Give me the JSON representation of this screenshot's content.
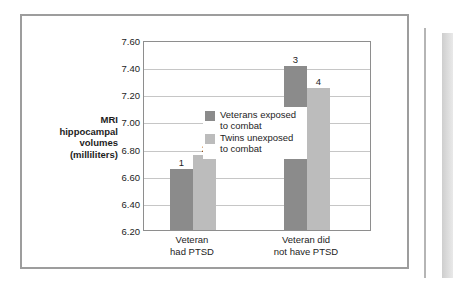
{
  "chart_data": {
    "type": "bar",
    "title": "",
    "xlabel": "",
    "ylabel": "MRI hippocampal volumes (milliliters)",
    "ylabel_lines": [
      "MRI",
      "hippocampal",
      "volumes",
      "(milliliters)"
    ],
    "ylim": [
      6.2,
      7.6
    ],
    "ytick_labels": [
      "7.60",
      "7.40",
      "7.20",
      "7.00",
      "6.80",
      "6.60",
      "6.40",
      "6.20"
    ],
    "ytick_values": [
      7.6,
      7.4,
      7.2,
      7.0,
      6.8,
      6.6,
      6.4,
      6.2
    ],
    "grid": true,
    "legend_position": "inside-right",
    "categories": [
      "Veteran had PTSD",
      "Veteran did not have PTSD"
    ],
    "category_lines": [
      [
        "Veteran",
        "had PTSD"
      ],
      [
        "Veteran did",
        "not have PTSD"
      ]
    ],
    "series": [
      {
        "name": "Veterans exposed to combat",
        "name_lines": [
          "Veterans exposed",
          "to combat"
        ],
        "color": "#8b8b8b",
        "values": [
          6.65,
          7.41
        ],
        "point_labels": [
          "1",
          "3"
        ]
      },
      {
        "name": "Twins unexposed to combat",
        "name_lines": [
          "Twins unexposed",
          "to combat"
        ],
        "color": "#bcbcbc",
        "values": [
          6.75,
          7.25
        ],
        "point_labels": [
          "2",
          "4"
        ]
      }
    ]
  },
  "legend": {
    "entries": [
      {
        "label": "Veterans exposed\nto combat",
        "color": "#8b8b8b"
      },
      {
        "label": "Twins unexposed\nto combat",
        "color": "#bcbcbc"
      }
    ]
  },
  "axes": {
    "y_title": "MRI\nhippocampal\nvolumes\n(milliliters)",
    "y_ticks": [
      "7.60",
      "7.40",
      "7.20",
      "7.00",
      "6.80",
      "6.60",
      "6.40",
      "6.20"
    ],
    "x_categories": [
      "Veteran\nhad PTSD",
      "Veteran did\nnot have PTSD"
    ]
  },
  "bars": [
    {
      "label": "1",
      "value": 6.65,
      "series": 0,
      "group": 0
    },
    {
      "label": "2",
      "value": 6.75,
      "series": 1,
      "group": 0
    },
    {
      "label": "3",
      "value": 7.41,
      "series": 0,
      "group": 1
    },
    {
      "label": "4",
      "value": 7.25,
      "series": 1,
      "group": 1
    }
  ],
  "colors": {
    "series_dark": "#8b8b8b",
    "series_light": "#bcbcbc",
    "gridline": "#c6c6c6",
    "axis": "#8e8e8e",
    "frame": "#9d9d9d",
    "text": "#1d1d1d"
  }
}
